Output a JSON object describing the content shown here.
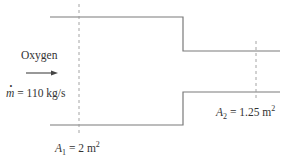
{
  "diagram": {
    "type": "duct-contraction",
    "fluid_label": "Oxygen",
    "mass_flow": {
      "symbol": "m",
      "equals": "=",
      "value": "110 kg/s"
    },
    "inlet_area": {
      "symbol": "A",
      "subscript": "1",
      "equals": "=",
      "value": "2 m",
      "unit_power": "2"
    },
    "outlet_area": {
      "symbol": "A",
      "subscript": "2",
      "equals": "=",
      "value": "1.25 m",
      "unit_power": "2"
    },
    "colors": {
      "line": "#7a7a7a",
      "dashed": "#9a9a9a",
      "text": "#333333"
    }
  }
}
